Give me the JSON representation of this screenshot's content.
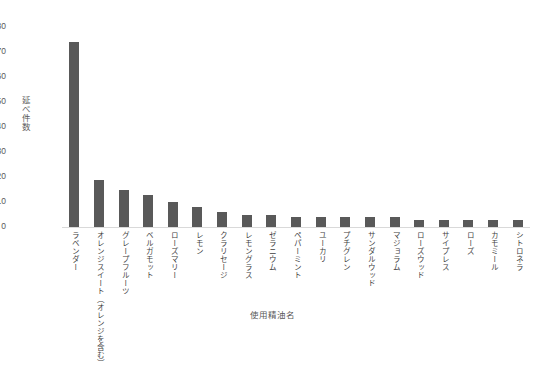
{
  "chart_data": {
    "type": "bar",
    "title": "",
    "xlabel": "使用精油名",
    "ylabel": "延べ件数",
    "ylim": [
      0,
      80
    ],
    "yticks": [
      0,
      10,
      20,
      30,
      40,
      50,
      60,
      70,
      80
    ],
    "grid": false,
    "legend": null,
    "bar_color": "#595959",
    "categories": [
      "ラベンダー",
      "オレンジスイート（オレンジを含む）",
      "グレープフルーツ",
      "ベルガモット",
      "ローズマリー",
      "レモン",
      "クラリセージ",
      "レモングラス",
      "ゼラニウム",
      "ペパーミント",
      "ユーカリ",
      "プチグレン",
      "サンダルウッド",
      "マジョラム",
      "ローズウッド",
      "サイプレス",
      "ローズ",
      "カモミール",
      "シトロネラ"
    ],
    "values": [
      74,
      19,
      15,
      13,
      10,
      8,
      6,
      5,
      5,
      4,
      4,
      4,
      4,
      4,
      3,
      3,
      3,
      3,
      3
    ]
  }
}
